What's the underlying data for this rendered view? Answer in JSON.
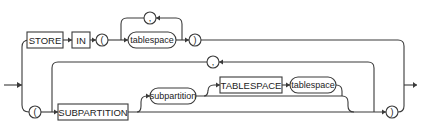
{
  "diagram": {
    "type": "railroad-syntax-diagram",
    "top_branch": {
      "keywords": [
        "STORE",
        "IN"
      ],
      "open_paren": "(",
      "repeat_item": "tablespace",
      "repeat_separator": ",",
      "close_paren": ")"
    },
    "bottom_branch": {
      "open_paren": "(",
      "keyword": "SUBPARTITION",
      "optional_item": "subpartition",
      "optional_keyword": "TABLESPACE",
      "optional_keyword_value": "tablespace",
      "repeat_separator": ",",
      "close_paren": ")"
    }
  },
  "colors": {
    "line": "#3a3a3a",
    "text": "#222222",
    "background": "#ffffff"
  }
}
